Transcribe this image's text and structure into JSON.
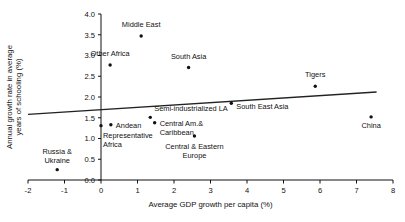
{
  "chart_data": {
    "type": "scatter",
    "title": "",
    "xlabel": "Average GDP growth per capita (%)",
    "ylabel": "Annual growth rate in average years of schooling (%)",
    "xlim": [
      -2,
      8
    ],
    "ylim": [
      0.0,
      4.0
    ],
    "xticks": [
      "-2",
      "-1",
      "0",
      "1",
      "2",
      "3",
      "4",
      "5",
      "6",
      "7",
      "8"
    ],
    "yticks": [
      "0.0",
      "0.5",
      "1.0",
      "1.5",
      "2.0",
      "2.5",
      "3.0",
      "3.5",
      "4.0"
    ],
    "grid": false,
    "legend": "none",
    "points": [
      {
        "label": "Middle East",
        "x": 1.1,
        "y": 3.47,
        "label_dx": 0,
        "label_dy": -9,
        "anchor": "middle"
      },
      {
        "label": "Other Africa",
        "x": 0.25,
        "y": 2.77,
        "label_dx": 0,
        "label_dy": -9,
        "anchor": "middle"
      },
      {
        "label": "South Asia",
        "x": 2.4,
        "y": 2.71,
        "label_dx": 0,
        "label_dy": -9,
        "anchor": "middle"
      },
      {
        "label": "Tigers",
        "x": 5.87,
        "y": 2.26,
        "label_dx": 0,
        "label_dy": -9,
        "anchor": "middle"
      },
      {
        "label": "South East Asia",
        "x": 3.57,
        "y": 1.85,
        "label_dx": 5,
        "label_dy": 6,
        "anchor": "start"
      },
      {
        "label": "Semi-industrialized LA",
        "x": 1.35,
        "y": 1.51,
        "label_dx": 4,
        "label_dy": -6,
        "anchor": "start"
      },
      {
        "label": "China",
        "x": 7.4,
        "y": 1.52,
        "label_dx": 0,
        "label_dy": 11,
        "anchor": "middle"
      },
      {
        "label": "Central Am.&",
        "x": 1.47,
        "y": 1.38,
        "label_dx": 5,
        "label_dy": 3,
        "anchor": "start"
      },
      {
        "label": "Caribbean",
        "x": 1.47,
        "y": 1.38,
        "label_dx": 5,
        "label_dy": 12,
        "anchor": "start"
      },
      {
        "label": "Andean",
        "x": 0.27,
        "y": 1.33,
        "label_dx": 5,
        "label_dy": 3,
        "anchor": "start"
      },
      {
        "label": "Representative",
        "x": 0.0,
        "y": 1.31,
        "label_dx": 2,
        "label_dy": 12,
        "anchor": "start"
      },
      {
        "label": "Africa",
        "x": 0.0,
        "y": 1.31,
        "label_dx": 2,
        "label_dy": 21,
        "anchor": "start"
      },
      {
        "label": "Central & Eastern",
        "x": 2.56,
        "y": 1.06,
        "label_dx": 0,
        "label_dy": 13,
        "anchor": "middle"
      },
      {
        "label": "Europe",
        "x": 2.56,
        "y": 1.06,
        "label_dx": 0,
        "label_dy": 22,
        "anchor": "middle"
      },
      {
        "label": "Russia &",
        "x": -1.2,
        "y": 0.25,
        "label_dx": 0,
        "label_dy": -16,
        "anchor": "middle"
      },
      {
        "label": "Ukraine",
        "x": -1.2,
        "y": 0.25,
        "label_dx": 0,
        "label_dy": -7,
        "anchor": "middle"
      }
    ],
    "trendline": {
      "x_start": -2.0,
      "y_start": 1.58,
      "x_end": 7.55,
      "y_end": 2.12
    },
    "colors": {
      "marker": "#111111",
      "trendline": "#222222",
      "axis": "#111111",
      "background": "#ffffff"
    }
  }
}
